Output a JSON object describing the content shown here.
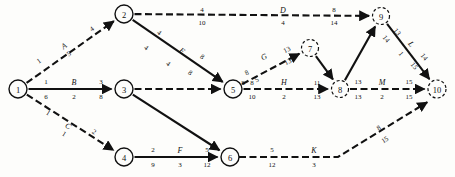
{
  "diagram": {
    "type": "activity-on-arrow-network",
    "colors": {
      "ink": "#111111",
      "paper": "#fdfdfb"
    },
    "nodes": [
      {
        "id": "1",
        "label": "1",
        "x": 18,
        "y": 89,
        "r": 9,
        "style": "solid"
      },
      {
        "id": "2",
        "label": "2",
        "x": 124,
        "y": 14,
        "r": 9,
        "style": "solid"
      },
      {
        "id": "3",
        "label": "3",
        "x": 124,
        "y": 89,
        "r": 9,
        "style": "solid"
      },
      {
        "id": "4",
        "label": "4",
        "x": 124,
        "y": 157,
        "r": 9,
        "style": "solid"
      },
      {
        "id": "5",
        "label": "5",
        "x": 233,
        "y": 89,
        "r": 9,
        "style": "solid"
      },
      {
        "id": "6",
        "label": "6",
        "x": 230,
        "y": 157,
        "r": 9,
        "style": "solid"
      },
      {
        "id": "7",
        "label": "7",
        "x": 310,
        "y": 48,
        "r": 8.5,
        "style": "dashed"
      },
      {
        "id": "8",
        "label": "8",
        "x": 340,
        "y": 89,
        "r": 8.5,
        "style": "dashed"
      },
      {
        "id": "9",
        "label": "9",
        "x": 381,
        "y": 16,
        "r": 8.5,
        "style": "dashed"
      },
      {
        "id": "10",
        "label": "10",
        "x": 437,
        "y": 89,
        "r": 9,
        "style": "dashed"
      }
    ],
    "edges": [
      {
        "name": "edge-1-2",
        "from": "1",
        "to": "2",
        "activity": "A",
        "style": "dashed",
        "arrow": true
      },
      {
        "name": "edge-1-3",
        "from": "1",
        "to": "3",
        "activity": "B",
        "style": "solid",
        "arrow": true
      },
      {
        "name": "edge-1-4",
        "from": "1",
        "to": "4",
        "activity": "C",
        "style": "dashed",
        "arrow": true
      },
      {
        "name": "edge-2-9",
        "from": "2",
        "to": "9",
        "activity": "D",
        "style": "dashed",
        "arrow": true
      },
      {
        "name": "edge-2-5",
        "from": "2",
        "to": "5",
        "activity": "E",
        "style": "solid",
        "arrow": true
      },
      {
        "name": "edge-3-5",
        "from": "3",
        "to": "5",
        "activity": "",
        "style": "dashed",
        "arrow": true
      },
      {
        "name": "edge-3-6",
        "from": "3",
        "to": "6",
        "activity": "",
        "style": "solid",
        "arrow": true
      },
      {
        "name": "edge-4-6",
        "from": "4",
        "to": "6",
        "activity": "F",
        "style": "solid",
        "arrow": true
      },
      {
        "name": "edge-5-7",
        "from": "5",
        "to": "7",
        "activity": "G",
        "style": "dashed",
        "arrow": true
      },
      {
        "name": "edge-5-8",
        "from": "5",
        "to": "8",
        "activity": "H",
        "style": "dashed",
        "arrow": true
      },
      {
        "name": "edge-7-8",
        "from": "7",
        "to": "8",
        "activity": "",
        "style": "solid",
        "arrow": true
      },
      {
        "name": "edge-8-9",
        "from": "8",
        "to": "9",
        "activity": "",
        "style": "solid",
        "arrow": true
      },
      {
        "name": "edge-8-10",
        "from": "8",
        "to": "10",
        "activity": "M",
        "style": "dashed",
        "arrow": true
      },
      {
        "name": "edge-9-10",
        "from": "9",
        "to": "10",
        "activity": "L",
        "style": "solid",
        "arrow": true
      },
      {
        "name": "edge-6-10",
        "from": "6",
        "to": "10",
        "activity": "K",
        "style": "dashed",
        "arrow": true
      }
    ],
    "labels": {
      "activities": [
        {
          "name": "activity-label-A",
          "text": "A",
          "x": 64,
          "y": 46,
          "rot": -36
        },
        {
          "name": "activity-label-B",
          "text": "B",
          "x": 74,
          "y": 82,
          "rot": 0
        },
        {
          "name": "activity-label-C",
          "text": "C",
          "x": 68,
          "y": 126,
          "rot": 33
        },
        {
          "name": "activity-label-D",
          "text": "D",
          "x": 283,
          "y": 10,
          "rot": 0
        },
        {
          "name": "activity-label-E",
          "text": "E",
          "x": 182,
          "y": 51,
          "rot": 36
        },
        {
          "name": "activity-label-F",
          "text": "F",
          "x": 180,
          "y": 150,
          "rot": 0
        },
        {
          "name": "activity-label-G",
          "text": "G",
          "x": 264,
          "y": 57,
          "rot": -27
        },
        {
          "name": "activity-label-H",
          "text": "H",
          "x": 284,
          "y": 82,
          "rot": 0
        },
        {
          "name": "activity-label-K",
          "text": "K",
          "x": 314,
          "y": 150,
          "rot": 0
        },
        {
          "name": "activity-label-L",
          "text": "L",
          "x": 411,
          "y": 44,
          "rot": 52
        },
        {
          "name": "activity-label-M",
          "text": "M",
          "x": 382,
          "y": 82,
          "rot": 0
        }
      ],
      "numbers": [
        {
          "name": "num-A-early-start",
          "text": "1",
          "x": 39,
          "y": 61,
          "rot": -36
        },
        {
          "name": "num-A-duration",
          "text": "5",
          "x": 69,
          "y": 54,
          "rot": -36
        },
        {
          "name": "num-A-early-finish",
          "text": "4",
          "x": 92,
          "y": 29,
          "rot": -36
        },
        {
          "name": "num-B-early-start",
          "text": "1",
          "x": 46,
          "y": 82,
          "rot": 0
        },
        {
          "name": "num-B-late-start",
          "text": "6",
          "x": 46,
          "y": 97,
          "rot": 0
        },
        {
          "name": "num-B-duration",
          "text": "2",
          "x": 74,
          "y": 97,
          "rot": 0
        },
        {
          "name": "num-B-early-finish",
          "text": "3",
          "x": 101,
          "y": 82,
          "rot": 0
        },
        {
          "name": "num-B-late-finish",
          "text": "8",
          "x": 101,
          "y": 97,
          "rot": 0
        },
        {
          "name": "num-C-early-start",
          "text": "1",
          "x": 48,
          "y": 113,
          "rot": 33
        },
        {
          "name": "num-C-duration",
          "text": "1",
          "x": 64,
          "y": 134,
          "rot": 33
        },
        {
          "name": "num-C-early-finish",
          "text": "2",
          "x": 94,
          "y": 132,
          "rot": 33
        },
        {
          "name": "num-D-early-start",
          "text": "4",
          "x": 202,
          "y": 10,
          "rot": 0
        },
        {
          "name": "num-D-late-start",
          "text": "10",
          "x": 202,
          "y": 23,
          "rot": 0
        },
        {
          "name": "num-D-duration",
          "text": "4",
          "x": 283,
          "y": 23,
          "rot": 0
        },
        {
          "name": "num-D-early-finish",
          "text": "8",
          "x": 334,
          "y": 10,
          "rot": 0
        },
        {
          "name": "num-D-late-finish",
          "text": "14",
          "x": 334,
          "y": 23,
          "rot": 0
        },
        {
          "name": "num-E-early-start",
          "text": "4",
          "x": 159,
          "y": 33,
          "rot": 36
        },
        {
          "name": "num-E-late-start",
          "text": "4",
          "x": 146,
          "y": 48,
          "rot": 36
        },
        {
          "name": "num-E-duration",
          "text": "4",
          "x": 168,
          "y": 64,
          "rot": 36
        },
        {
          "name": "num-E-early-finish",
          "text": "8",
          "x": 202,
          "y": 57,
          "rot": 36
        },
        {
          "name": "num-E-late-finish",
          "text": "8",
          "x": 190,
          "y": 73,
          "rot": 36
        },
        {
          "name": "num-F-early-start",
          "text": "2",
          "x": 153,
          "y": 150,
          "rot": 0
        },
        {
          "name": "num-F-late-start",
          "text": "9",
          "x": 153,
          "y": 165,
          "rot": 0
        },
        {
          "name": "num-F-duration",
          "text": "3",
          "x": 180,
          "y": 165,
          "rot": 0
        },
        {
          "name": "num-F-early-finish",
          "text": "5",
          "x": 207,
          "y": 150,
          "rot": 0
        },
        {
          "name": "num-F-late-finish",
          "text": "12",
          "x": 207,
          "y": 165,
          "rot": 0
        },
        {
          "name": "num-G-early-start",
          "text": "8",
          "x": 247,
          "y": 73,
          "rot": -27
        },
        {
          "name": "num-G-late-start",
          "text": "8",
          "x": 243,
          "y": 83,
          "rot": 0
        },
        {
          "name": "num-G-duration",
          "text": "5",
          "x": 257,
          "y": 80,
          "rot": -27
        },
        {
          "name": "num-G-early-finish",
          "text": "13",
          "x": 287,
          "y": 50,
          "rot": -27
        },
        {
          "name": "num-G-late-finish",
          "text": "13",
          "x": 288,
          "y": 62,
          "rot": -27
        },
        {
          "name": "num-H-early-start",
          "text": "8",
          "x": 252,
          "y": 83,
          "rot": 0
        },
        {
          "name": "num-H-late-start",
          "text": "10",
          "x": 252,
          "y": 97,
          "rot": 0
        },
        {
          "name": "num-H-duration",
          "text": "2",
          "x": 284,
          "y": 97,
          "rot": 0
        },
        {
          "name": "num-H-early-finish",
          "text": "11",
          "x": 317,
          "y": 83,
          "rot": 0
        },
        {
          "name": "num-H-late-finish",
          "text": "13",
          "x": 317,
          "y": 97,
          "rot": 0
        },
        {
          "name": "num-M-early-start",
          "text": "13",
          "x": 358,
          "y": 82,
          "rot": 0
        },
        {
          "name": "num-M-late-start",
          "text": "13",
          "x": 358,
          "y": 97,
          "rot": 0
        },
        {
          "name": "num-M-duration",
          "text": "2",
          "x": 382,
          "y": 97,
          "rot": 0
        },
        {
          "name": "num-M-early-finish",
          "text": "15",
          "x": 409,
          "y": 82,
          "rot": 0
        },
        {
          "name": "num-M-late-finish",
          "text": "15",
          "x": 409,
          "y": 97,
          "rot": 0
        },
        {
          "name": "num-L-early-start",
          "text": "13",
          "x": 397,
          "y": 32,
          "rot": 52
        },
        {
          "name": "num-L-late-start",
          "text": "14",
          "x": 386,
          "y": 39,
          "rot": 52
        },
        {
          "name": "num-L-duration",
          "text": "1",
          "x": 401,
          "y": 54,
          "rot": 52
        },
        {
          "name": "num-L-early-finish",
          "text": "14",
          "x": 424,
          "y": 57,
          "rot": 52
        },
        {
          "name": "num-L-late-finish",
          "text": "15",
          "x": 414,
          "y": 66,
          "rot": 52
        },
        {
          "name": "num-K-early-start",
          "text": "5",
          "x": 272,
          "y": 150,
          "rot": 0
        },
        {
          "name": "num-K-late-start",
          "text": "12",
          "x": 272,
          "y": 165,
          "rot": 0
        },
        {
          "name": "num-K-duration",
          "text": "3",
          "x": 314,
          "y": 165,
          "rot": 0
        },
        {
          "name": "num-K-early-finish",
          "text": "8",
          "x": 379,
          "y": 128,
          "rot": -33
        },
        {
          "name": "num-K-late-finish",
          "text": "15",
          "x": 385,
          "y": 140,
          "rot": -33
        }
      ]
    }
  }
}
